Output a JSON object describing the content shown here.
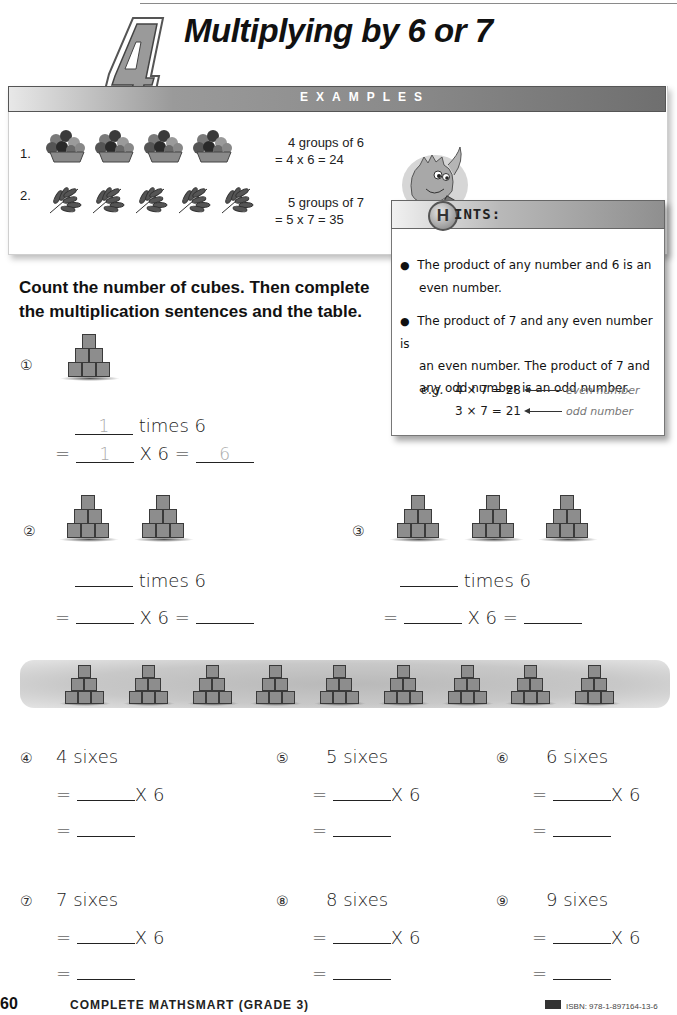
{
  "header": {
    "chapter_number": "4",
    "title": "Multiplying by 6 or 7"
  },
  "examples": {
    "bar_label": "EXAMPLES",
    "items": [
      {
        "number": "1.",
        "picture": "flower-pot",
        "count": 4,
        "line1": "4 groups of 6",
        "line2": "= 4 x 6 = 24"
      },
      {
        "number": "2.",
        "picture": "leaf-branch",
        "count": 5,
        "line1": "5 groups of 7",
        "line2": "= 5 x 7 = 35"
      }
    ]
  },
  "hints": {
    "letter": "H",
    "label": "INTS:",
    "bullets": [
      {
        "line1": "The product of any number and 6 is an",
        "line2": "even number."
      },
      {
        "line1": "The product of 7 and any even number is",
        "line2": "an even number.  The product of 7 and",
        "line3": "any odd number is an odd number."
      }
    ],
    "eg_label": "e.g.",
    "examples": [
      {
        "equation": "4 × 7 = 28",
        "note": "even number"
      },
      {
        "equation": "3 × 7 = 21",
        "note": "odd number"
      }
    ]
  },
  "instructions": {
    "line1": "Count the number of cubes.  Then complete",
    "line2": "the multiplication sentences and the table."
  },
  "questions_cubes": [
    {
      "num": "①",
      "groups": 1,
      "times_text": "times 6",
      "x_text": "X 6 =",
      "eq": "=",
      "answer_groups": "1",
      "answer_factor": "1",
      "answer_product": "6"
    },
    {
      "num": "②",
      "groups": 2,
      "times_text": "times 6",
      "x_text": "X 6 =",
      "eq": "=",
      "answer_groups": "",
      "answer_factor": "",
      "answer_product": ""
    },
    {
      "num": "③",
      "groups": 3,
      "times_text": "times 6",
      "x_text": "X 6 =",
      "eq": "=",
      "answer_groups": "",
      "answer_factor": "",
      "answer_product": ""
    }
  ],
  "strip": {
    "pyramid_count": 9
  },
  "questions_sixes": [
    {
      "num": "④",
      "label": "4 sixes",
      "eq": "=",
      "x_text": "X 6"
    },
    {
      "num": "⑤",
      "label": "5 sixes",
      "eq": "=",
      "x_text": "X 6"
    },
    {
      "num": "⑥",
      "label": "6 sixes",
      "eq": "=",
      "x_text": "X 6"
    },
    {
      "num": "⑦",
      "label": "7 sixes",
      "eq": "=",
      "x_text": "X 6"
    },
    {
      "num": "⑧",
      "label": "8 sixes",
      "eq": "=",
      "x_text": "X 6"
    },
    {
      "num": "⑨",
      "label": "9 sixes",
      "eq": "=",
      "x_text": "X 6"
    }
  ],
  "footer": {
    "page_number": "60",
    "book_title": "COMPLETE MATHSMART (GRADE 3)",
    "isbn": "ISBN: 978-1-897164-13-6"
  }
}
